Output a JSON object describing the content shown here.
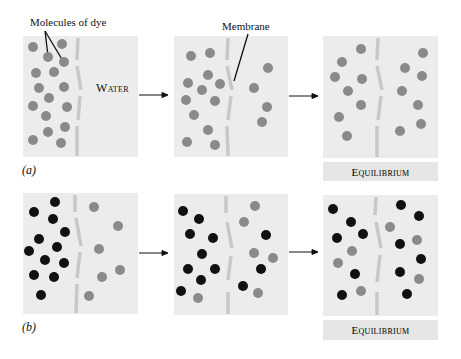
{
  "labels": {
    "molecules_of_dye": "Molecules of dye",
    "membrane": "Membrane",
    "water": "Water",
    "part_a": "(a)",
    "part_b": "(b)",
    "equilibrium_a": "Equilibrium",
    "equilibrium_b": "Equilibrium"
  },
  "colors": {
    "panel_bg": "#ececec",
    "membrane": "#c8c8c8",
    "gray_dye": "#8a8a8a",
    "black_dye": "#111111"
  },
  "rows": [
    {
      "id": "a",
      "panels": [
        {
          "gray": [
            [
              33,
              47
            ],
            [
              62,
              44
            ],
            [
              48,
              57
            ],
            [
              64,
              62
            ],
            [
              36,
              73
            ],
            [
              54,
              72
            ],
            [
              39,
              88
            ],
            [
              64,
              87
            ],
            [
              49,
              98
            ],
            [
              33,
              106
            ],
            [
              67,
              107
            ],
            [
              46,
              116
            ],
            [
              65,
              127
            ],
            [
              48,
              132
            ],
            [
              33,
              140
            ],
            [
              61,
              143
            ]
          ],
          "black": []
        },
        {
          "gray": [
            [
              191,
              56
            ],
            [
              210,
              53
            ],
            [
              208,
              75
            ],
            [
              188,
              83
            ],
            [
              220,
              84
            ],
            [
              202,
              90
            ],
            [
              186,
              100
            ],
            [
              215,
              101
            ],
            [
              194,
              115
            ],
            [
              208,
              130
            ],
            [
              187,
              142
            ],
            [
              215,
              145
            ],
            [
              268,
              68
            ],
            [
              254,
              88
            ],
            [
              267,
              107
            ],
            [
              262,
              122
            ]
          ],
          "black": []
        },
        {
          "gray": [
            [
              361,
              49
            ],
            [
              342,
              62
            ],
            [
              335,
              77
            ],
            [
              362,
              79
            ],
            [
              348,
              91
            ],
            [
              361,
              105
            ],
            [
              339,
              117
            ],
            [
              347,
              136
            ],
            [
              423,
              53
            ],
            [
              405,
              68
            ],
            [
              422,
              76
            ],
            [
              402,
              91
            ],
            [
              418,
              105
            ],
            [
              400,
              131
            ],
            [
              421,
              124
            ]
          ],
          "black": []
        }
      ]
    },
    {
      "id": "b",
      "panels": [
        {
          "black": [
            [
              55,
              202
            ],
            [
              34,
              212
            ],
            [
              53,
              219
            ],
            [
              65,
              232
            ],
            [
              39,
              239
            ],
            [
              29,
              251
            ],
            [
              57,
              247
            ],
            [
              45,
              260
            ],
            [
              64,
              263
            ],
            [
              34,
              275
            ],
            [
              54,
              277
            ],
            [
              41,
              295
            ]
          ],
          "gray": [
            [
              94,
              207
            ],
            [
              118,
              226
            ],
            [
              99,
              249
            ],
            [
              120,
              270
            ],
            [
              102,
              277
            ],
            [
              89,
              296
            ]
          ]
        },
        {
          "black": [
            [
              183,
              211
            ],
            [
              199,
              219
            ],
            [
              190,
              234
            ],
            [
              213,
              238
            ],
            [
              202,
              254
            ],
            [
              188,
              269
            ],
            [
              215,
              269
            ],
            [
              201,
              280
            ],
            [
              181,
              291
            ],
            [
              266,
              235
            ],
            [
              261,
              269
            ],
            [
              243,
              286
            ]
          ],
          "gray": [
            [
              255,
              206
            ],
            [
              244,
              222
            ],
            [
              254,
              253
            ],
            [
              273,
              258
            ],
            [
              198,
              298
            ],
            [
              258,
              293
            ]
          ]
        },
        {
          "black": [
            [
              333,
              209
            ],
            [
              351,
              222
            ],
            [
              337,
              238
            ],
            [
              363,
              234
            ],
            [
              355,
              274
            ],
            [
              342,
              295
            ],
            [
              401,
              205
            ],
            [
              419,
              216
            ],
            [
              400,
              244
            ],
            [
              421,
              259
            ],
            [
              400,
              272
            ],
            [
              407,
              294
            ]
          ],
          "gray": [
            [
              352,
              251
            ],
            [
              338,
              263
            ],
            [
              361,
              291
            ],
            [
              390,
              227
            ],
            [
              417,
              240
            ],
            [
              419,
              279
            ]
          ]
        }
      ]
    }
  ]
}
